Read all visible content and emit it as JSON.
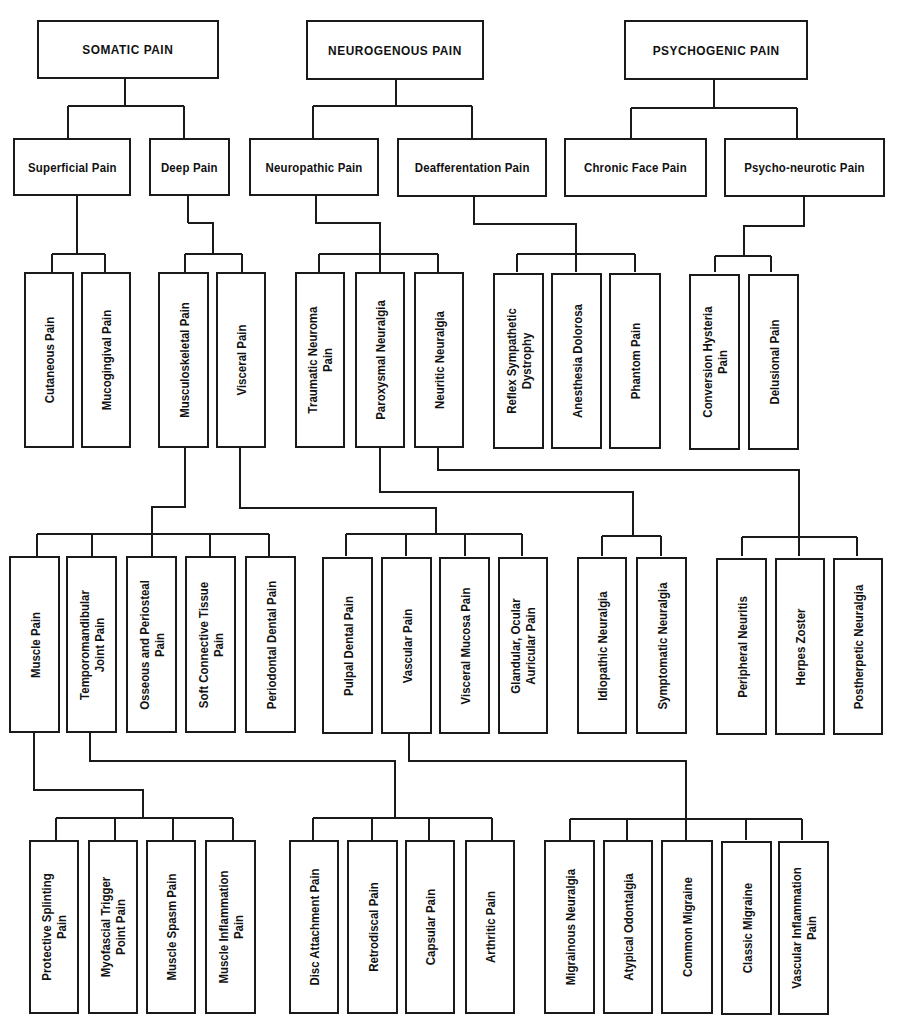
{
  "colors": {
    "line": "#1a1a1a",
    "background": "#ffffff"
  },
  "level1": [
    {
      "id": "somatic",
      "label": "SOMATIC PAIN"
    },
    {
      "id": "neurogenous",
      "label": "NEUROGENOUS PAIN"
    },
    {
      "id": "psychogenic",
      "label": "PSYCHOGENIC PAIN"
    }
  ],
  "level2": [
    {
      "id": "superficial",
      "label": "Superficial Pain",
      "parent": "somatic"
    },
    {
      "id": "deep",
      "label": "Deep Pain",
      "parent": "somatic"
    },
    {
      "id": "neuropathic",
      "label": "Neuropathic Pain",
      "parent": "neurogenous"
    },
    {
      "id": "deafferentation",
      "label": "Deafferentation Pain",
      "parent": "neurogenous"
    },
    {
      "id": "chronic_face",
      "label": "Chronic Face Pain",
      "parent": "psychogenic"
    },
    {
      "id": "psycho_neurotic",
      "label": "Psycho-neurotic Pain",
      "parent": "psychogenic"
    }
  ],
  "level3": [
    {
      "id": "cutaneous",
      "label": "Cutaneous Pain",
      "parent": "superficial"
    },
    {
      "id": "mucogingival",
      "label": "Mucogingival Pain",
      "parent": "superficial"
    },
    {
      "id": "musculoskeletal",
      "label": "Musculoskeletal Pain",
      "parent": "deep"
    },
    {
      "id": "visceral",
      "label": "Visceral Pain",
      "parent": "deep"
    },
    {
      "id": "traumatic_neuroma",
      "label": "Traumatic Neuroma\nPain",
      "parent": "neuropathic"
    },
    {
      "id": "paroxysmal",
      "label": "Paroxysmal Neuralgia",
      "parent": "neuropathic"
    },
    {
      "id": "neuritic",
      "label": "Neuritic Neuralgia",
      "parent": "neuropathic"
    },
    {
      "id": "reflex_sympathetic",
      "label": "Reflex Sympathetic\nDystrophy",
      "parent": "deafferentation"
    },
    {
      "id": "anesthesia_dolorosa",
      "label": "Anesthesia Dolorosa",
      "parent": "deafferentation"
    },
    {
      "id": "phantom",
      "label": "Phantom Pain",
      "parent": "deafferentation"
    },
    {
      "id": "conversion_hysteria",
      "label": "Conversion Hysteria\nPain",
      "parent": "psycho_neurotic"
    },
    {
      "id": "delusional",
      "label": "Delusional Pain",
      "parent": "psycho_neurotic"
    }
  ],
  "level4": [
    {
      "id": "muscle",
      "label": "Muscle Pain",
      "parent": "musculoskeletal"
    },
    {
      "id": "tmj",
      "label": "Temporomandibular\nJoint Pain",
      "parent": "musculoskeletal"
    },
    {
      "id": "osseous",
      "label": "Osseous and Periosteal\nPain",
      "parent": "musculoskeletal"
    },
    {
      "id": "soft_connective",
      "label": "Soft Connective Tissue\nPain",
      "parent": "musculoskeletal"
    },
    {
      "id": "periodontal",
      "label": "Periodontal Dental Pain",
      "parent": "musculoskeletal"
    },
    {
      "id": "pulpal",
      "label": "Pulpal Dental Pain",
      "parent": "visceral"
    },
    {
      "id": "vascular",
      "label": "Vascular Pain",
      "parent": "visceral"
    },
    {
      "id": "visceral_mucosa",
      "label": "Visceral Mucosa Pain",
      "parent": "visceral"
    },
    {
      "id": "glandular",
      "label": "Glandular, Ocular\nAuricular Pain",
      "parent": "visceral"
    },
    {
      "id": "idiopathic",
      "label": "Idiopathic Neuralgia",
      "parent": "paroxysmal"
    },
    {
      "id": "symptomatic",
      "label": "Symptomatic Neuralgia",
      "parent": "paroxysmal"
    },
    {
      "id": "peripheral_neuritis",
      "label": "Peripheral Neuritis",
      "parent": "neuritic"
    },
    {
      "id": "herpes_zoster",
      "label": "Herpes Zoster",
      "parent": "neuritic"
    },
    {
      "id": "postherpetic",
      "label": "Postherpetic Neuralgia",
      "parent": "neuritic"
    }
  ],
  "level5": [
    {
      "id": "protective_splinting",
      "label": "Protective Splinting\nPain",
      "parent": "muscle"
    },
    {
      "id": "myofascial",
      "label": "Myofascial Trigger\nPoint Pain",
      "parent": "muscle"
    },
    {
      "id": "muscle_spasm",
      "label": "Muscle Spasm Pain",
      "parent": "muscle"
    },
    {
      "id": "muscle_inflammation",
      "label": "Muscle Inflammation\nPain",
      "parent": "muscle"
    },
    {
      "id": "disc_attachment",
      "label": "Disc Attachment Pain",
      "parent": "tmj"
    },
    {
      "id": "retrodiscal",
      "label": "Retrodiscal Pain",
      "parent": "tmj"
    },
    {
      "id": "capsular",
      "label": "Capsular Pain",
      "parent": "tmj"
    },
    {
      "id": "arthritic",
      "label": "Arthritic Pain",
      "parent": "tmj"
    },
    {
      "id": "migrainous",
      "label": "Migrainous Neuralgia",
      "parent": "vascular"
    },
    {
      "id": "atypical_odontalgia",
      "label": "Atypical Odontalgia",
      "parent": "vascular"
    },
    {
      "id": "common_migraine",
      "label": "Common Migraine",
      "parent": "vascular"
    },
    {
      "id": "classic_migraine",
      "label": "Classic Migraine",
      "parent": "vascular"
    },
    {
      "id": "vascular_inflammation",
      "label": "Vascular Inflammation\nPain",
      "parent": "vascular"
    }
  ]
}
